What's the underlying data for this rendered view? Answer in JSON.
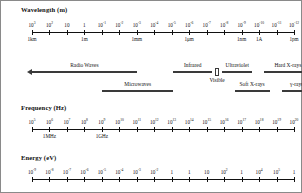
{
  "figure": {
    "background": "#ffffff",
    "line_color": "#111111",
    "band_color": "#3a3a3a"
  },
  "chart_data": {
    "type": "diagram",
    "axes": [
      {
        "id": "wavelength",
        "label": "Wavelength (m)",
        "tick_labels_above": [
          "10³",
          "10²",
          "10",
          "1",
          "10⁻¹",
          "10⁻²",
          "10⁻³",
          "10⁻⁴",
          "10⁻⁵",
          "10⁻⁶",
          "10⁻⁷",
          "10⁻⁸",
          "10⁻⁹",
          "10⁻¹⁰",
          "10⁻¹¹",
          "10⁻¹²"
        ],
        "tick_mantissas": [
          "10",
          "10",
          "10",
          "1",
          "10",
          "10",
          "10",
          "10",
          "10",
          "10",
          "10",
          "10",
          "10",
          "10",
          "10",
          "10"
        ],
        "tick_exponents": [
          "3",
          "2",
          "",
          "",
          "-1",
          "-2",
          "-3",
          "-4",
          "-5",
          "-6",
          "-7",
          "-8",
          "-9",
          "-10",
          "-11",
          "-12"
        ],
        "unit_labels": [
          {
            "index": 0,
            "text": "1km"
          },
          {
            "index": 3,
            "text": "1m"
          },
          {
            "index": 6,
            "text": "1mm"
          },
          {
            "index": 9,
            "text": "1μm"
          },
          {
            "index": 12,
            "text": "1nm"
          },
          {
            "index": 13,
            "text": "1A"
          },
          {
            "index": 15,
            "text": "1pm"
          }
        ]
      },
      {
        "id": "frequency",
        "label": "Frequency (Hz)",
        "tick_mantissas": [
          "10",
          "10",
          "10",
          "10",
          "10",
          "10",
          "10",
          "10",
          "10",
          "10",
          "10",
          "10",
          "10",
          "10",
          "10",
          "10"
        ],
        "tick_exponents": [
          "5",
          "6",
          "7",
          "8",
          "9",
          "10",
          "11",
          "12",
          "13",
          "14",
          "15",
          "16",
          "17",
          "18",
          "19",
          "20"
        ],
        "unit_labels": [
          {
            "index": 1,
            "text": "1MHz"
          },
          {
            "index": 4,
            "text": "1GHz"
          }
        ]
      },
      {
        "id": "energy",
        "label": "Energy (eV)",
        "tick_mantissas": [
          "10",
          "10",
          "10",
          "10",
          "10",
          "10",
          "10",
          "10",
          "1",
          "1",
          "10",
          "10",
          "1",
          "10",
          "10",
          "1"
        ],
        "tick_exponents": [
          "-9",
          "-8",
          "-7",
          "-6",
          "-5",
          "-4",
          "-3",
          "-2",
          "",
          "",
          "",
          "2",
          "",
          "4",
          "5",
          ""
        ],
        "tick_texts": [
          "10⁻⁹",
          "10⁻⁸",
          "10⁻⁷",
          "10⁻⁶",
          "10⁻⁵",
          "10⁻⁴",
          "10⁻³",
          "10⁻²",
          "10⁻¹",
          "1eV",
          "10",
          "10²",
          "1keV",
          "10⁴",
          "10⁵",
          "1MeV"
        ],
        "special_labels": [
          {
            "index": 9,
            "text": "1eV"
          },
          {
            "index": 12,
            "text": "1keV"
          },
          {
            "index": 15,
            "text": "1MeV"
          }
        ]
      }
    ],
    "bands": [
      {
        "name": "Radio Waves",
        "row": 1,
        "start_index": 0,
        "end_index": 6.0,
        "arrow": "left"
      },
      {
        "name": "Infrared",
        "row": 1,
        "start_index": 8.1,
        "end_index": 10.3,
        "arrow": "none"
      },
      {
        "name": "Ultraviolet",
        "row": 1,
        "start_index": 10.9,
        "end_index": 12.6,
        "arrow": "none"
      },
      {
        "name": "Hard X-rays",
        "row": 1,
        "start_index": 13.3,
        "end_index": 16,
        "arrow": "right"
      },
      {
        "name": "Microwaves",
        "row": 2,
        "start_index": 4.0,
        "end_index": 8.1,
        "arrow": "none"
      },
      {
        "name": "Soft X-rays",
        "row": 2,
        "start_index": 11.6,
        "end_index": 13.6,
        "arrow": "none"
      },
      {
        "name": "γ-rays",
        "row": 2,
        "start_index": 14.3,
        "end_index": 16,
        "arrow": "right"
      }
    ],
    "visible_marker": {
      "label": "Visible",
      "index": 10.6
    }
  }
}
